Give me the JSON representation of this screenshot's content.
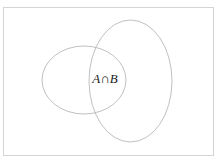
{
  "figure": {
    "kind": "venn-diagram",
    "label": "Venn diagram of two overlapping sets",
    "background_color": "#ffffff",
    "frame": {
      "border_color": "#d4d4d4",
      "x": 3,
      "y": 7,
      "width": 211,
      "height": 149
    },
    "stroke_color": "#b9b9b9",
    "text_color": "#1a1a1a",
    "sets": [
      {
        "name": "set-a",
        "shape": "ellipse",
        "cx": 84,
        "cy": 80,
        "rx": 42,
        "ry": 34
      },
      {
        "name": "set-b",
        "shape": "ellipse",
        "cx": 130.5,
        "cy": 81,
        "rx": 41.5,
        "ry": 61
      }
    ],
    "annotations": [
      {
        "name": "intersection-label",
        "first_operand": "A",
        "operator": "∩",
        "second_operand": "B",
        "full_text": "A∩B",
        "x": 105,
        "y": 80
      }
    ]
  }
}
